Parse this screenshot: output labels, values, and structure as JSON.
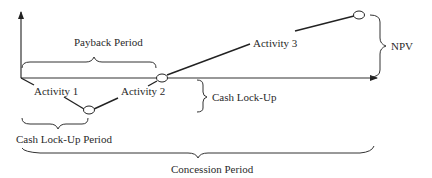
{
  "diagram": {
    "labels": {
      "payback_period": "Payback Period",
      "activity_1": "Activity 1",
      "activity_2": "Activity 2",
      "activity_3": "Activity 3",
      "npv": "NPV",
      "cash_lock_up": "Cash Lock-Up",
      "cash_lock_up_period": "Cash Lock-Up Period",
      "concession_period": "Concession Period"
    },
    "colors": {
      "line": "#222222",
      "axis": "#333333",
      "brace": "#333333",
      "node_fill": "#ffffff"
    }
  }
}
